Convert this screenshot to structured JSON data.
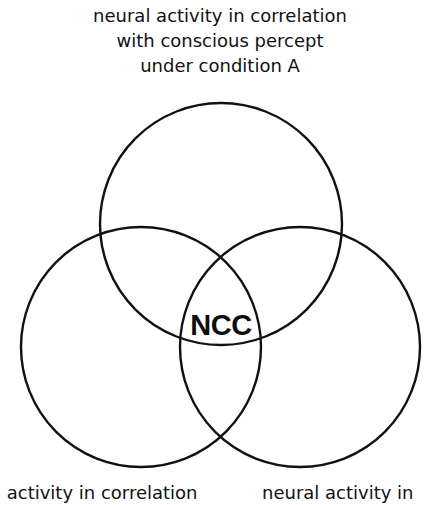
{
  "diagram": {
    "type": "venn",
    "top_label": {
      "lines": [
        "neural activity in correlation",
        "with conscious percept",
        "under condition A"
      ]
    },
    "center_label": "NCC",
    "bottom_labels": {
      "left": "l activity in correlation",
      "right": "neural activity in"
    },
    "circles": [
      {
        "name": "condition-A",
        "cx": 221,
        "cy": 224,
        "r": 121
      },
      {
        "name": "bottom-left",
        "cx": 141,
        "cy": 347,
        "r": 120
      },
      {
        "name": "bottom-right",
        "cx": 300,
        "cy": 347,
        "r": 120
      }
    ],
    "stroke_color": "#111111"
  }
}
